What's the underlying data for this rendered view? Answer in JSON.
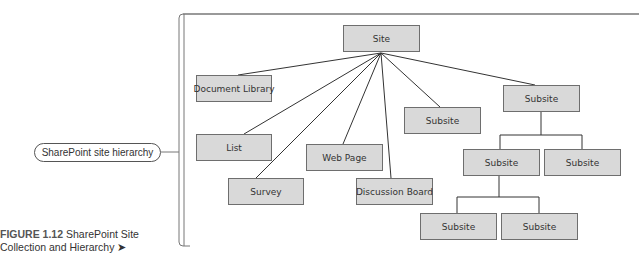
{
  "diagram": {
    "side_label": "SharePoint site hierarchy",
    "caption": {
      "figure_number": "FIGURE 1.12",
      "line1": " SharePoint Site",
      "line2": "Collection and Hierarchy",
      "arrow": "➤"
    },
    "nodes": {
      "site": "Site",
      "document_library": "Document Library",
      "list": "List",
      "web_page": "Web Page",
      "survey": "Survey",
      "discussion_board": "Discussion Board",
      "subsite_1": "Subsite",
      "subsite_2": "Subsite",
      "subsite_2a": "Subsite",
      "subsite_2b": "Subsite",
      "subsite_2a_i": "Subsite",
      "subsite_2a_ii": "Subsite"
    },
    "edges": [
      [
        "site",
        "document_library"
      ],
      [
        "site",
        "list"
      ],
      [
        "site",
        "survey"
      ],
      [
        "site",
        "web_page"
      ],
      [
        "site",
        "discussion_board"
      ],
      [
        "site",
        "subsite_1"
      ],
      [
        "site",
        "subsite_2"
      ],
      [
        "subsite_2",
        "subsite_2a"
      ],
      [
        "subsite_2",
        "subsite_2b"
      ],
      [
        "subsite_2a",
        "subsite_2a_i"
      ],
      [
        "subsite_2a",
        "subsite_2a_ii"
      ]
    ],
    "colors": {
      "node_fill": "#d9d9d9",
      "node_border": "#6e6e6e",
      "line": "#333333",
      "bracket": "#777777"
    }
  }
}
